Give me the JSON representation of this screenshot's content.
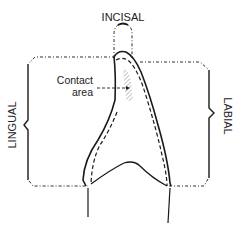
{
  "diagram": {
    "labels": {
      "incisal": "INCISAL",
      "lingual": "LINGUAL",
      "labial": "LABIAL",
      "contact_line1": "Contact",
      "contact_line2": "area"
    },
    "colors": {
      "stroke": "#1a1a1a",
      "hatch": "#888888",
      "background": "#ffffff"
    }
  }
}
